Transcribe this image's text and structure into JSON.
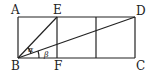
{
  "diagram": {
    "points": {
      "A": "A",
      "B": "B",
      "C": "C",
      "D": "D",
      "E": "E",
      "F": "F"
    },
    "angles": {
      "alpha": "α",
      "beta": "β"
    },
    "segments": [
      "AD",
      "BC",
      "AB",
      "DC",
      "EF",
      "BE",
      "BD",
      "middle-vertical"
    ]
  }
}
